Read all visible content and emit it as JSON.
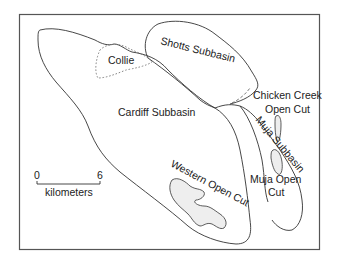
{
  "map": {
    "frame": {
      "x": 19,
      "y": 14,
      "width": 300,
      "height": 235
    },
    "labels": {
      "collie": "Collie",
      "shotts": "Shotts Subbasin",
      "cardiff": "Cardiff Subbasin",
      "chicken_creek_line1": "Chicken Creek",
      "chicken_creek_line2": "Open Cut",
      "muja_subbasin": "Muja Subbasin",
      "muja_open_cut_line1": "Muja Open",
      "muja_open_cut_line2": "Cut",
      "western_open_cut": "Western Open Cut"
    },
    "scale_bar": {
      "start_label": "0",
      "end_label": "6",
      "unit_label": "kilometers"
    },
    "colors": {
      "outline": "#333333",
      "frame": "#555555",
      "pit_fill": "#eeeeee"
    }
  }
}
